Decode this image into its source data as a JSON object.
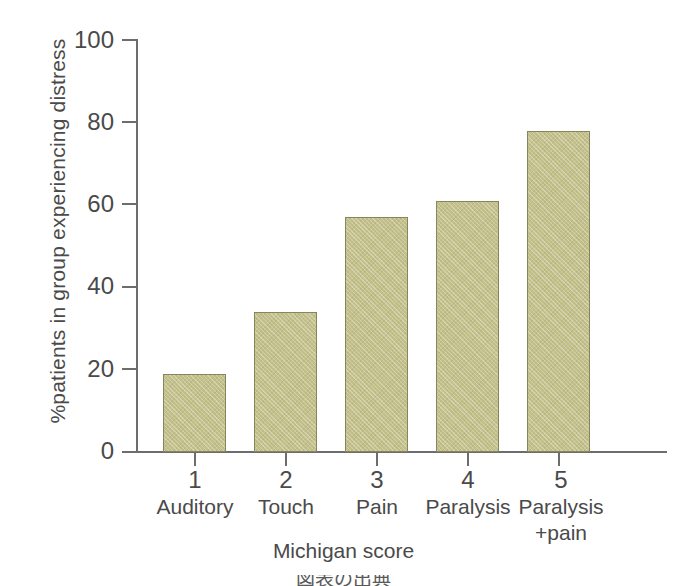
{
  "chart_data": {
    "type": "bar",
    "title": "",
    "categories": [
      "1",
      "2",
      "3",
      "4",
      "5"
    ],
    "category_names": [
      "Auditory",
      "Touch",
      "Pain",
      "Paralysis",
      "Paralysis"
    ],
    "category_names_line2": [
      "",
      "",
      "",
      "",
      "+pain"
    ],
    "values": [
      19,
      34,
      57,
      61,
      78
    ],
    "xlabel": "Michigan score",
    "ylabel": "%patients in group experiencing distress",
    "ylim": [
      0,
      100
    ],
    "yticks": [
      0,
      20,
      40,
      60,
      80,
      100
    ],
    "ytick_labels": [
      "0",
      "20",
      "40",
      "60",
      "80",
      "100"
    ],
    "grid": false,
    "legend": false,
    "bar_color": "#c3c08a",
    "bar_edge_color": "#86855c",
    "axis_color": "#6d6d6d",
    "text_color": "#4a4a4a",
    "background": "#ffffff"
  },
  "footer": {
    "cropped_text": "図表の出典"
  }
}
